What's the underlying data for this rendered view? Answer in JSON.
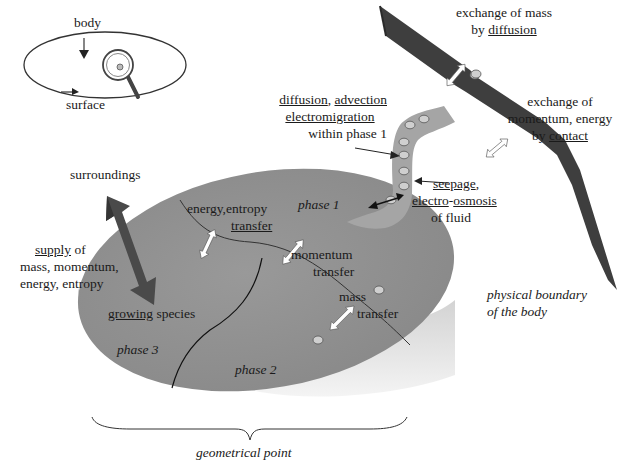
{
  "colors": {
    "disk_top": "#8c8c8c",
    "disk_side": "#dcdcdc",
    "boundary": "#3c3c3c",
    "fluid": "#a0a0a0",
    "big_arrow": "#4a4a4a",
    "particle": "#c8c8c8",
    "text": "#1a1a1a"
  },
  "inset": {
    "body_label": "body",
    "surface_label": "surface"
  },
  "labels": {
    "exchange_mass": {
      "line1": "exchange of mass",
      "line2_plain": "by ",
      "line2_underlined": "diffusion"
    },
    "exchange_momentum": {
      "line1": "exchange of",
      "line2": "momentum, energy",
      "line3_plain": "by ",
      "line3_underlined": "contact"
    },
    "within_phase": {
      "line1_u1": "diffusion",
      "line1_sep": ", ",
      "line1_u2": "advection",
      "line2_underlined": "electromigration",
      "line3": "within phase 1"
    },
    "seepage": {
      "line1_underlined": "seepage",
      "line1_tail": ",",
      "line2_u1": "electro",
      "line2_sep": "-",
      "line2_u2": "osmosis",
      "line3": "of fluid"
    },
    "surroundings": "surroundings",
    "supply": {
      "line1_underlined": "supply",
      "line1_tail": " of",
      "line2": "mass, momentum,",
      "line3": "energy, entropy"
    },
    "growing": {
      "underlined": "growing",
      "tail": " species"
    },
    "energy_transfer": {
      "line1": "energy,entropy",
      "line2_underlined": "transfer"
    },
    "momentum_transfer": {
      "line1": "momentum",
      "line2": "transfer"
    },
    "mass_transfer": {
      "line1": "mass",
      "line2": "transfer"
    },
    "phase1": "phase 1",
    "phase2": "phase 2",
    "phase3": "phase 3",
    "physical_boundary": {
      "line1": "physical boundary",
      "line2": "of the body"
    },
    "geometrical_point": "geometrical point"
  }
}
